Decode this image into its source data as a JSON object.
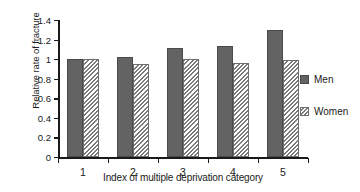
{
  "chart_data": {
    "type": "bar",
    "title": "",
    "subtitle": "",
    "xlabel": "Index of multiple deprivation category",
    "ylabel": "Relative rate of fracture",
    "categories": [
      "1",
      "2",
      "3",
      "4",
      "5"
    ],
    "series": [
      {
        "name": "Men",
        "values": [
          1.0,
          1.02,
          1.11,
          1.13,
          1.3
        ],
        "color": "#636363",
        "fill": "solid"
      },
      {
        "name": "Women",
        "values": [
          1.0,
          0.95,
          1.0,
          0.96,
          0.99
        ],
        "color": "#7a7a7a",
        "fill": "diagonal-hatch"
      }
    ],
    "ylim": [
      0,
      1.4
    ],
    "yticks": [
      "0",
      "0.2",
      "0.4",
      "0.6",
      "0.8",
      "1",
      "1.2",
      "1.4"
    ],
    "ytick_values": [
      0,
      0.2,
      0.4,
      0.6,
      0.8,
      1.0,
      1.2,
      1.4
    ],
    "xtick_labels": [
      "1",
      "2",
      "3",
      "4",
      "5"
    ],
    "grid": false,
    "legend_position": "right"
  },
  "legend": {
    "entries": [
      {
        "label": "Men"
      },
      {
        "label": "Women"
      }
    ]
  },
  "colors": {
    "men": "#636363",
    "women": "#7a7a7a",
    "axis": "#1a1a1a",
    "background": "#ffffff"
  }
}
